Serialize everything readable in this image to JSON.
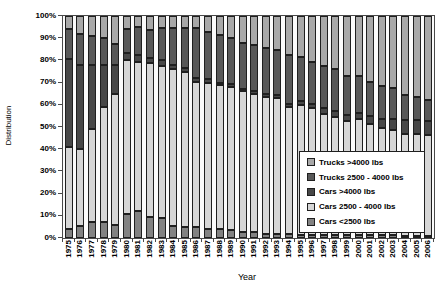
{
  "chart_data": {
    "type": "bar",
    "stacked": true,
    "percent_stacked": true,
    "grid": false,
    "xlabel": "Year",
    "ylabel": "Distribution",
    "ylim": [
      0,
      100
    ],
    "y_ticks": [
      "0%",
      "10%",
      "20%",
      "30%",
      "40%",
      "50%",
      "60%",
      "70%",
      "80%",
      "90%",
      "100%"
    ],
    "categories": [
      "1975",
      "1976",
      "1977",
      "1978",
      "1979",
      "1980",
      "1981",
      "1982",
      "1983",
      "1984",
      "1985",
      "1986",
      "1987",
      "1988",
      "1989",
      "1990",
      "1991",
      "1992",
      "1993",
      "1994",
      "1995",
      "1996",
      "1997",
      "1998",
      "1999",
      "2000",
      "2001",
      "2002",
      "2003",
      "2004",
      "2005",
      "2006"
    ],
    "series": [
      {
        "name": "Cars <2500 lbs",
        "color": "#828282",
        "values": [
          4,
          5.5,
          7,
          7,
          6,
          11,
          12,
          9.5,
          9,
          5.5,
          5,
          5,
          4,
          4,
          3.5,
          2.5,
          2.5,
          2,
          2,
          2,
          1.5,
          1.5,
          1.5,
          1.5,
          1.5,
          1.5,
          1.5,
          1.5,
          1.5,
          1,
          1,
          1
        ]
      },
      {
        "name": "Cars 2500 - 4000 lbs",
        "color": "#d6d6d6",
        "values": [
          37,
          34.5,
          42,
          52,
          59,
          69,
          67.5,
          69.5,
          68.5,
          70.5,
          70,
          65.5,
          66,
          65,
          64.5,
          63.5,
          62.5,
          61.5,
          61,
          57,
          58.5,
          57,
          54.5,
          53,
          51,
          52,
          50,
          48,
          47,
          46,
          45.7,
          45.2
        ]
      },
      {
        "name": "Cars >4000 lbs",
        "color": "#474747",
        "values": [
          39.5,
          38,
          29,
          19,
          13,
          3.5,
          3,
          2,
          2.5,
          2,
          1.5,
          1.5,
          1.5,
          1,
          1.5,
          1,
          1,
          1.5,
          1.5,
          1.5,
          1.5,
          2,
          2.5,
          2.5,
          3,
          3,
          3.5,
          4,
          5,
          6,
          6.5,
          6.6
        ]
      },
      {
        "name": "Trucks 2500 - 4000 lbs",
        "color": "#585858",
        "values": [
          13.5,
          14,
          13,
          12,
          9.5,
          10.5,
          12.5,
          12.5,
          14.5,
          16.5,
          18,
          22.5,
          21.5,
          21.5,
          20.5,
          21,
          20.8,
          20.6,
          20,
          22,
          20,
          19,
          18.8,
          19,
          17.5,
          16.5,
          15.5,
          15,
          14,
          11.4,
          10.2,
          9.3
        ]
      },
      {
        "name": "Trucks >4000 lbs",
        "color": "#a8a8a8",
        "values": [
          6,
          8,
          9,
          10,
          12.5,
          6,
          5,
          6.5,
          5.5,
          5.5,
          5.5,
          5.5,
          7,
          8.5,
          10,
          12,
          13.2,
          14.4,
          15.5,
          17.5,
          18.5,
          20.5,
          22.7,
          24,
          27,
          27,
          29.5,
          31.5,
          32.5,
          35.6,
          36.6,
          37.9
        ]
      }
    ],
    "legend": {
      "position": "inside-bottom-right",
      "order_top_to_bottom": [
        "Trucks >4000 lbs",
        "Trucks 2500 - 4000 lbs",
        "Cars >4000 lbs",
        "Cars 2500 - 4000 lbs",
        "Cars <2500 lbs"
      ]
    }
  }
}
